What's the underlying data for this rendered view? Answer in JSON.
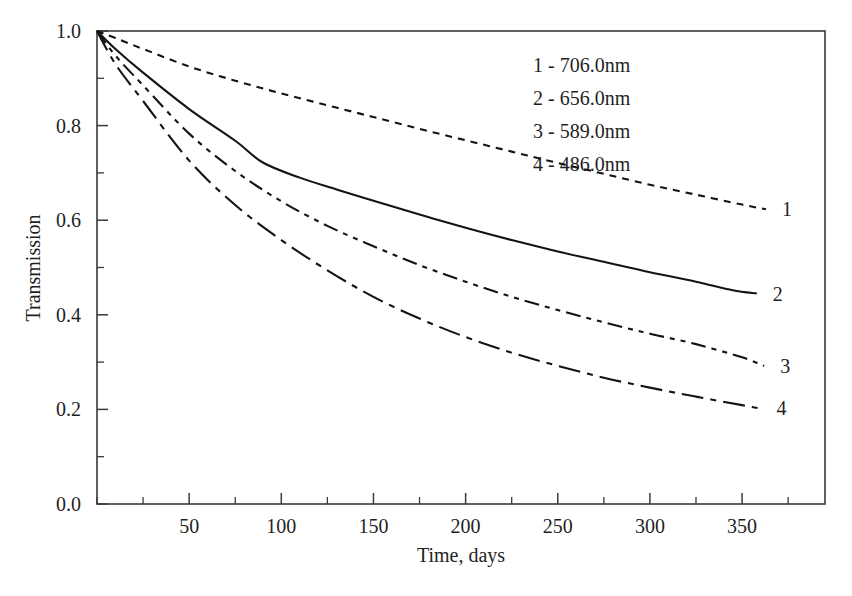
{
  "chart_data": {
    "type": "line",
    "title": "",
    "xlabel": "Time, days",
    "ylabel": "Transmission",
    "xlim": [
      0,
      395
    ],
    "ylim": [
      0.0,
      1.0
    ],
    "grid": false,
    "legend_position": "top-right-inside",
    "x_major_ticks": [
      50,
      100,
      150,
      200,
      250,
      300,
      350
    ],
    "x_major_tick_labels": [
      "50",
      "100",
      "150",
      "200",
      "250",
      "300",
      "350"
    ],
    "x_minor_ticks": [
      0,
      25,
      75,
      125,
      175,
      225,
      275,
      325,
      375
    ],
    "y_major_ticks": [
      0.0,
      0.2,
      0.4,
      0.6,
      0.8,
      1.0
    ],
    "y_major_tick_labels": [
      "0.0",
      "0.2",
      "0.4",
      "0.6",
      "0.8",
      "1.0"
    ],
    "y_minor_ticks": [
      0.1,
      0.3,
      0.5,
      0.7,
      0.9
    ],
    "legend_entries": [
      "1 - 706.0nm",
      "2 - 656.0nm",
      "3 - 589.0nm",
      "4 - 486.0nm"
    ],
    "series": [
      {
        "name": "1 - 706.0nm",
        "wavelength_nm": 706.0,
        "end_label": "1",
        "line_style": "dotted-short-dash",
        "color": "#141414",
        "x": [
          0,
          10,
          25,
          50,
          75,
          100,
          125,
          150,
          175,
          200,
          225,
          250,
          275,
          300,
          325,
          350,
          363
        ],
        "values": [
          1.0,
          0.985,
          0.962,
          0.925,
          0.895,
          0.868,
          0.843,
          0.818,
          0.793,
          0.769,
          0.745,
          0.721,
          0.698,
          0.675,
          0.654,
          0.633,
          0.623
        ]
      },
      {
        "name": "2 - 656.0nm",
        "wavelength_nm": 656.0,
        "end_label": "2",
        "line_style": "solid",
        "color": "#141414",
        "x": [
          0,
          10,
          25,
          50,
          75,
          90,
          110,
          130,
          150,
          175,
          200,
          225,
          250,
          275,
          300,
          325,
          345,
          358
        ],
        "values": [
          1.0,
          0.962,
          0.912,
          0.835,
          0.768,
          0.722,
          0.69,
          0.665,
          0.641,
          0.612,
          0.584,
          0.558,
          0.534,
          0.512,
          0.49,
          0.47,
          0.452,
          0.445
        ]
      },
      {
        "name": "3 - 589.0nm",
        "wavelength_nm": 589.0,
        "end_label": "3",
        "line_style": "dash-dot-dot",
        "color": "#141414",
        "x": [
          0,
          10,
          25,
          50,
          75,
          100,
          125,
          150,
          175,
          200,
          225,
          250,
          275,
          300,
          325,
          350,
          362
        ],
        "values": [
          1.0,
          0.948,
          0.885,
          0.783,
          0.704,
          0.64,
          0.588,
          0.545,
          0.505,
          0.47,
          0.438,
          0.41,
          0.384,
          0.36,
          0.338,
          0.31,
          0.292
        ]
      },
      {
        "name": "4 - 486.0nm",
        "wavelength_nm": 486.0,
        "end_label": "4",
        "line_style": "long-dash-dot",
        "color": "#141414",
        "x": [
          0,
          10,
          25,
          50,
          75,
          100,
          125,
          150,
          175,
          200,
          225,
          250,
          275,
          300,
          325,
          350,
          360
        ],
        "values": [
          1.0,
          0.93,
          0.852,
          0.726,
          0.632,
          0.558,
          0.494,
          0.438,
          0.392,
          0.353,
          0.32,
          0.292,
          0.267,
          0.246,
          0.227,
          0.209,
          0.202
        ]
      }
    ]
  }
}
